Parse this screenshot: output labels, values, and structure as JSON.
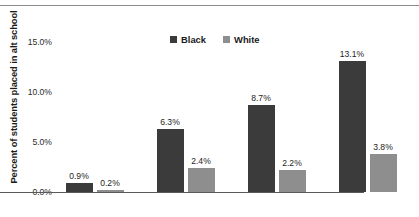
{
  "chart_data": {
    "type": "bar",
    "title": "",
    "subtitle": "",
    "xlabel": "",
    "ylabel": "Percent of students placed in alt school",
    "categories": [
      "Elementary",
      "Middle",
      "High",
      "Total"
    ],
    "series": [
      {
        "name": "Black",
        "color": "#3b3b3b",
        "values": [
          0.9,
          6.3,
          8.7,
          13.1
        ],
        "labels": [
          "0.9%",
          "6.3%",
          "8.7%",
          "13.1%"
        ]
      },
      {
        "name": "White",
        "color": "#8e8e8e",
        "values": [
          0.2,
          2.4,
          2.2,
          3.8
        ],
        "labels": [
          "0.2%",
          "2.4%",
          "2.2%",
          "3.8%"
        ]
      }
    ],
    "ylim": [
      0,
      17.2
    ],
    "yticks": [
      0,
      5,
      10,
      15
    ],
    "ytick_labels": [
      "0.0%",
      "5.0%",
      "10.0%",
      "15.0%"
    ],
    "grid": false,
    "legend_position": "top-center",
    "value_labels": true,
    "top_rule": true
  }
}
